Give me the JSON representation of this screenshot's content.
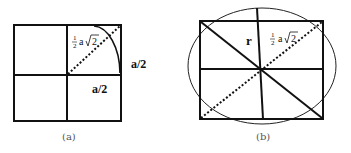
{
  "figure_a": {
    "caption": "(a)",
    "labels": {
      "half": "1",
      "half_den": "2",
      "diag_expr": "a",
      "sqrt_arg": "2",
      "right_side": "a/2",
      "bottom_side": "a/2"
    }
  },
  "figure_b": {
    "caption": "(b)",
    "labels": {
      "radius": "r",
      "half": "1",
      "half_den": "2",
      "diag_expr": "a",
      "sqrt_arg": "2"
    }
  },
  "colors": {
    "stroke": "#111111",
    "caption": "#555555"
  }
}
